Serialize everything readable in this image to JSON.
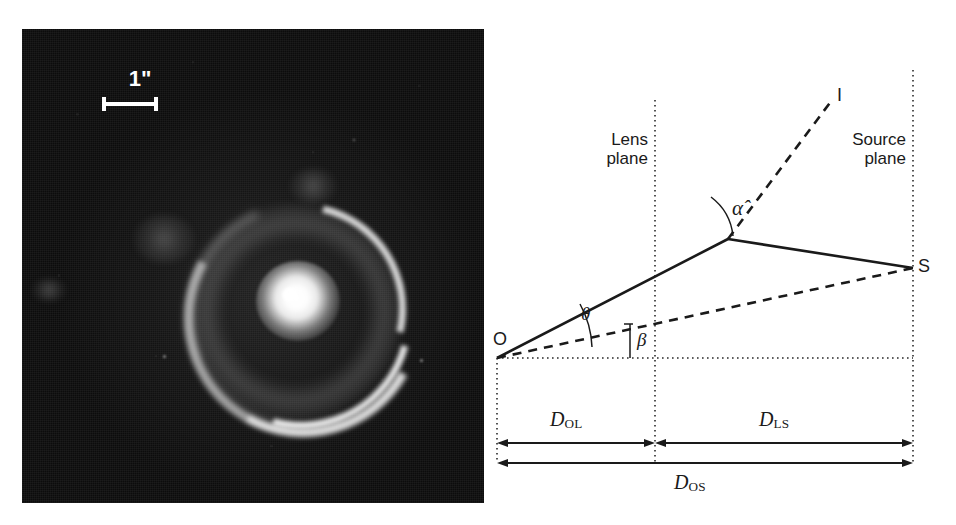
{
  "figure": {
    "kind": "gravitational-lensing-figure",
    "panels": [
      "einstein-ring-photograph",
      "lens-geometry-diagram"
    ]
  },
  "photo": {
    "scalebar": {
      "label": "1\"",
      "icon": "scale-bar-icon"
    },
    "features": {
      "ring": "einstein-ring",
      "core": "lensing-galaxy-core"
    },
    "background_color": "#0c0c0c",
    "feature_color": "#ffffff"
  },
  "diagram": {
    "planes": [
      {
        "name": "lens-plane",
        "line1": "Lens",
        "line2": "plane"
      },
      {
        "name": "source-plane",
        "line1": "Source",
        "line2": "plane"
      }
    ],
    "points": [
      {
        "name": "observer",
        "label": "O"
      },
      {
        "name": "image",
        "label": "I"
      },
      {
        "name": "source",
        "label": "S"
      }
    ],
    "angles": [
      {
        "name": "deflection-angle",
        "label": "α̂"
      },
      {
        "name": "image-angle",
        "label": "θ"
      },
      {
        "name": "source-angle",
        "label": "β"
      }
    ],
    "distances": [
      {
        "name": "observer-lens-distance",
        "symbol": "D",
        "subscript": "OL"
      },
      {
        "name": "lens-source-distance",
        "symbol": "D",
        "subscript": "LS"
      },
      {
        "name": "observer-source-distance",
        "symbol": "D",
        "subscript": "OS"
      }
    ],
    "line_color": "#1a1a1a"
  },
  "caption": {
    "text": ""
  }
}
